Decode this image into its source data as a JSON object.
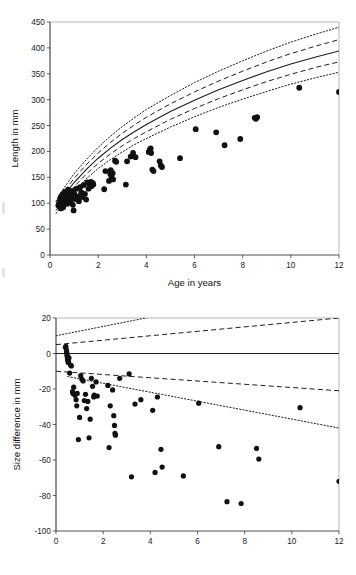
{
  "figure": {
    "background": "#ffffff",
    "ink_color": "#111111",
    "frame_color": "#9a9a9a"
  },
  "chart_data": [
    {
      "id": "length-vs-age",
      "type": "scatter",
      "title": "",
      "xlabel": "Age in years",
      "ylabel": "Length in mm",
      "xlim": [
        0,
        12
      ],
      "ylim": [
        0,
        450
      ],
      "xticks": [
        0,
        2,
        4,
        6,
        8,
        10,
        12
      ],
      "yticks": [
        0,
        50,
        100,
        150,
        200,
        250,
        300,
        350,
        400,
        450
      ],
      "xtick_labels": [
        "0",
        "2",
        "4",
        "6",
        "8",
        "10",
        "12"
      ],
      "ytick_labels": [
        "0",
        "50",
        "100",
        "150",
        "200",
        "250",
        "300",
        "350",
        "400",
        "450"
      ],
      "grid": false,
      "legend": "none",
      "points": [
        [
          0.35,
          96
        ],
        [
          0.38,
          101
        ],
        [
          0.4,
          93
        ],
        [
          0.42,
          108
        ],
        [
          0.44,
          99
        ],
        [
          0.45,
          112
        ],
        [
          0.46,
          90
        ],
        [
          0.48,
          104
        ],
        [
          0.5,
          97
        ],
        [
          0.52,
          117
        ],
        [
          0.54,
          107
        ],
        [
          0.55,
          92
        ],
        [
          0.58,
          113
        ],
        [
          0.6,
          101
        ],
        [
          0.62,
          122
        ],
        [
          0.65,
          110
        ],
        [
          0.68,
          105
        ],
        [
          0.7,
          118
        ],
        [
          0.72,
          99
        ],
        [
          0.75,
          126
        ],
        [
          0.78,
          113
        ],
        [
          0.8,
          108
        ],
        [
          0.82,
          120
        ],
        [
          0.85,
          103
        ],
        [
          0.88,
          116
        ],
        [
          0.9,
          111
        ],
        [
          0.92,
          124
        ],
        [
          0.95,
          97
        ],
        [
          0.98,
          86
        ],
        [
          1.0,
          119
        ],
        [
          1.05,
          108
        ],
        [
          1.1,
          128
        ],
        [
          1.15,
          113
        ],
        [
          1.2,
          104
        ],
        [
          1.25,
          131
        ],
        [
          1.3,
          121
        ],
        [
          1.35,
          112
        ],
        [
          1.4,
          135
        ],
        [
          1.45,
          118
        ],
        [
          1.5,
          107
        ],
        [
          1.55,
          140
        ],
        [
          1.6,
          128
        ],
        [
          1.65,
          137
        ],
        [
          1.7,
          141
        ],
        [
          1.72,
          133
        ],
        [
          1.78,
          139
        ],
        [
          1.8,
          136
        ],
        [
          2.25,
          127
        ],
        [
          2.3,
          162
        ],
        [
          2.45,
          143
        ],
        [
          2.5,
          157
        ],
        [
          2.52,
          164
        ],
        [
          2.55,
          152
        ],
        [
          2.6,
          158
        ],
        [
          2.62,
          146
        ],
        [
          2.7,
          182
        ],
        [
          2.75,
          180
        ],
        [
          3.15,
          136
        ],
        [
          3.2,
          181
        ],
        [
          3.35,
          190
        ],
        [
          3.45,
          197
        ],
        [
          3.55,
          189
        ],
        [
          4.1,
          199
        ],
        [
          4.15,
          204
        ],
        [
          4.18,
          206
        ],
        [
          4.2,
          197
        ],
        [
          4.25,
          165
        ],
        [
          4.3,
          162
        ],
        [
          4.55,
          181
        ],
        [
          4.6,
          173
        ],
        [
          4.65,
          170
        ],
        [
          5.4,
          187
        ],
        [
          6.05,
          243
        ],
        [
          6.9,
          237
        ],
        [
          7.25,
          212
        ],
        [
          7.9,
          224
        ],
        [
          8.5,
          265
        ],
        [
          8.55,
          263
        ],
        [
          8.6,
          266
        ],
        [
          10.35,
          323
        ],
        [
          12.0,
          315
        ]
      ],
      "curves": [
        {
          "name": "mean-reference",
          "style": "solid",
          "points": [
            [
              0.25,
              92
            ],
            [
              0.5,
              110
            ],
            [
              1.0,
              140
            ],
            [
              1.5,
              165
            ],
            [
              2.0,
              187
            ],
            [
              2.5,
              206
            ],
            [
              3.0,
              223
            ],
            [
              3.5,
              238
            ],
            [
              4.0,
              252
            ],
            [
              5.0,
              277
            ],
            [
              6.0,
              299
            ],
            [
              7.0,
              319
            ],
            [
              8.0,
              337
            ],
            [
              9.0,
              354
            ],
            [
              10.0,
              369
            ],
            [
              11.0,
              382
            ],
            [
              12.0,
              394
            ]
          ]
        },
        {
          "name": "inner-band-upper",
          "style": "dashed",
          "points": [
            [
              0.25,
              98
            ],
            [
              0.5,
              117
            ],
            [
              1.0,
              148
            ],
            [
              1.5,
              174
            ],
            [
              2.0,
              197
            ],
            [
              2.5,
              217
            ],
            [
              3.0,
              235
            ],
            [
              3.5,
              251
            ],
            [
              4.0,
              266
            ],
            [
              5.0,
              292
            ],
            [
              6.0,
              315
            ],
            [
              7.0,
              336
            ],
            [
              8.0,
              355
            ],
            [
              9.0,
              373
            ],
            [
              10.0,
              389
            ],
            [
              11.0,
              403
            ],
            [
              12.0,
              416
            ]
          ]
        },
        {
          "name": "inner-band-lower",
          "style": "dashed",
          "points": [
            [
              0.25,
              86
            ],
            [
              0.5,
              103
            ],
            [
              1.0,
              132
            ],
            [
              1.5,
              156
            ],
            [
              2.0,
              177
            ],
            [
              2.5,
              195
            ],
            [
              3.0,
              211
            ],
            [
              3.5,
              225
            ],
            [
              4.0,
              238
            ],
            [
              5.0,
              262
            ],
            [
              6.0,
              283
            ],
            [
              7.0,
              302
            ],
            [
              8.0,
              319
            ],
            [
              9.0,
              335
            ],
            [
              10.0,
              349
            ],
            [
              11.0,
              362
            ],
            [
              12.0,
              373
            ]
          ]
        },
        {
          "name": "outer-band-upper",
          "style": "dotted",
          "points": [
            [
              0.25,
              104
            ],
            [
              0.5,
              124
            ],
            [
              1.0,
              157
            ],
            [
              1.5,
              184
            ],
            [
              2.0,
              208
            ],
            [
              2.5,
              229
            ],
            [
              3.0,
              248
            ],
            [
              3.5,
              265
            ],
            [
              4.0,
              281
            ],
            [
              5.0,
              308
            ],
            [
              6.0,
              333
            ],
            [
              7.0,
              355
            ],
            [
              8.0,
              375
            ],
            [
              9.0,
              394
            ],
            [
              10.0,
              411
            ],
            [
              11.0,
              426
            ],
            [
              12.0,
              440
            ]
          ]
        },
        {
          "name": "outer-band-lower",
          "style": "dotted",
          "points": [
            [
              0.25,
              80
            ],
            [
              0.5,
              96
            ],
            [
              1.0,
              124
            ],
            [
              1.5,
              147
            ],
            [
              2.0,
              167
            ],
            [
              2.5,
              184
            ],
            [
              3.0,
              199
            ],
            [
              3.5,
              213
            ],
            [
              4.0,
              225
            ],
            [
              5.0,
              247
            ],
            [
              6.0,
              267
            ],
            [
              7.0,
              285
            ],
            [
              8.0,
              301
            ],
            [
              9.0,
              316
            ],
            [
              10.0,
              330
            ],
            [
              11.0,
              342
            ],
            [
              12.0,
              353
            ]
          ]
        }
      ]
    },
    {
      "id": "size-difference-vs-age",
      "type": "scatter",
      "title": "",
      "xlabel": "",
      "ylabel": "Size difference in mm",
      "xlim": [
        0,
        12
      ],
      "ylim": [
        -100,
        20
      ],
      "xticks": [
        0,
        2,
        4,
        6,
        8,
        10,
        12
      ],
      "yticks": [
        -100,
        -80,
        -60,
        -40,
        -20,
        0,
        20
      ],
      "xtick_labels": [
        "0",
        "2",
        "4",
        "6",
        "8",
        "10",
        "12"
      ],
      "ytick_labels": [
        "-100",
        "-80",
        "-60",
        "-40",
        "-20",
        "0",
        "20"
      ],
      "grid": false,
      "legend": "none",
      "points": [
        [
          0.4,
          3.5
        ],
        [
          0.42,
          4.0
        ],
        [
          0.44,
          2.0
        ],
        [
          0.45,
          1.0
        ],
        [
          0.46,
          0.0
        ],
        [
          0.47,
          -1.0
        ],
        [
          0.48,
          -2.0
        ],
        [
          0.49,
          -3.0
        ],
        [
          0.5,
          -4.0
        ],
        [
          0.52,
          -5.0
        ],
        [
          0.53,
          -4.5
        ],
        [
          0.55,
          -2.5
        ],
        [
          0.58,
          -11.0
        ],
        [
          0.62,
          -6.5
        ],
        [
          0.65,
          -7.0
        ],
        [
          0.7,
          -21.5
        ],
        [
          0.72,
          -22.5
        ],
        [
          0.75,
          -19.0
        ],
        [
          0.8,
          -23.5
        ],
        [
          0.85,
          -26.0
        ],
        [
          0.88,
          -29.5
        ],
        [
          0.9,
          -22.5
        ],
        [
          0.95,
          -48.5
        ],
        [
          1.0,
          -36.0
        ],
        [
          1.05,
          -12.5
        ],
        [
          1.1,
          -14.5
        ],
        [
          1.15,
          -15.5
        ],
        [
          1.2,
          -26.5
        ],
        [
          1.25,
          -23.0
        ],
        [
          1.3,
          -31.0
        ],
        [
          1.35,
          -27.0
        ],
        [
          1.4,
          -47.5
        ],
        [
          1.45,
          -37.0
        ],
        [
          1.5,
          -14.0
        ],
        [
          1.55,
          -18.5
        ],
        [
          1.6,
          -24.5
        ],
        [
          1.62,
          -23.5
        ],
        [
          1.7,
          -16.0
        ],
        [
          1.75,
          -24.0
        ],
        [
          2.2,
          -18.0
        ],
        [
          2.25,
          -53.0
        ],
        [
          2.3,
          -29.5
        ],
        [
          2.4,
          -20.5
        ],
        [
          2.45,
          -35.0
        ],
        [
          2.48,
          -40.5
        ],
        [
          2.5,
          -45.0
        ],
        [
          2.52,
          -46.0
        ],
        [
          2.7,
          -14.0
        ],
        [
          3.1,
          -11.5
        ],
        [
          3.2,
          -69.5
        ],
        [
          3.35,
          -28.5
        ],
        [
          3.6,
          -26.0
        ],
        [
          4.1,
          -32.0
        ],
        [
          4.2,
          -67.0
        ],
        [
          4.3,
          -24.5
        ],
        [
          4.45,
          -54.0
        ],
        [
          4.5,
          -64.0
        ],
        [
          5.4,
          -69.0
        ],
        [
          6.05,
          -28.0
        ],
        [
          6.9,
          -52.5
        ],
        [
          7.25,
          -83.5
        ],
        [
          7.85,
          -84.5
        ],
        [
          8.5,
          -53.5
        ],
        [
          8.6,
          -59.5
        ],
        [
          10.35,
          -30.5
        ],
        [
          12.0,
          -72.0
        ]
      ],
      "curves": [
        {
          "name": "zero-reference",
          "style": "solid",
          "points": [
            [
              0,
              0
            ],
            [
              12,
              0
            ]
          ]
        },
        {
          "name": "inner-band-upper",
          "style": "dashed",
          "points": [
            [
              0,
              5
            ],
            [
              12,
              20
            ]
          ]
        },
        {
          "name": "inner-band-lower",
          "style": "dashed",
          "points": [
            [
              0,
              -10
            ],
            [
              12,
              -21
            ]
          ]
        },
        {
          "name": "outer-band-upper",
          "style": "dotted",
          "points": [
            [
              0,
              10
            ],
            [
              4.0,
              20.5
            ]
          ]
        },
        {
          "name": "outer-band-lower",
          "style": "dotted",
          "points": [
            [
              0.5,
              -13
            ],
            [
              12,
              -42
            ]
          ]
        }
      ]
    }
  ]
}
